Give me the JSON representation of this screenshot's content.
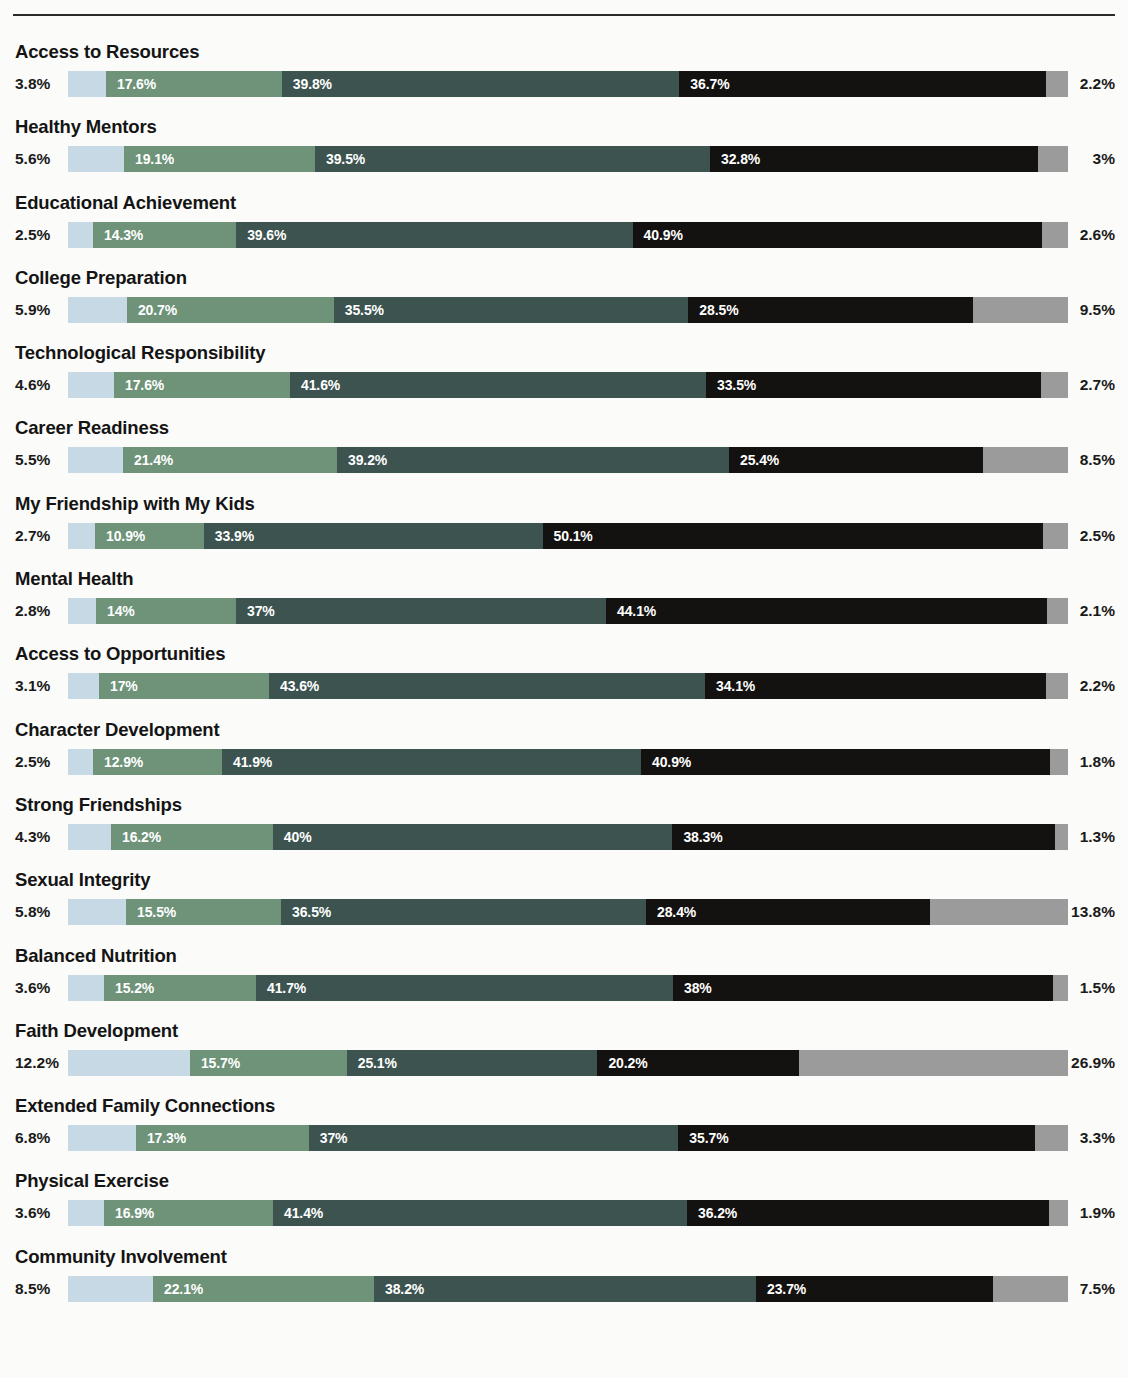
{
  "chart_data": {
    "type": "bar",
    "subtype": "stacked-horizontal-100",
    "title": "",
    "subtitle": "",
    "xlabel": "",
    "ylabel": "",
    "xlim": [
      0,
      100
    ],
    "grid": false,
    "legend_position": "none",
    "units": "percent",
    "series": [
      {
        "name": "segment-1",
        "color": "#c6d9e4",
        "label_visible": "left-outside"
      },
      {
        "name": "segment-2",
        "color": "#6e9379",
        "label_visible": "inside"
      },
      {
        "name": "segment-3",
        "color": "#3c5350",
        "label_visible": "inside"
      },
      {
        "name": "segment-4",
        "color": "#141210",
        "label_visible": "inside"
      },
      {
        "name": "segment-5",
        "color": "#9b9b9b",
        "label_visible": "right-outside"
      }
    ],
    "categories": [
      "Access to Resources",
      "Healthy Mentors",
      "Educational Achievement",
      "College Preparation",
      "Technological Responsibility",
      "Career Readiness",
      "My Friendship with My Kids",
      "Mental Health",
      "Access to Opportunities",
      "Character Development",
      "Strong Friendships",
      "Sexual Integrity",
      "Balanced Nutrition",
      "Faith Development",
      "Extended Family Connections",
      "Physical Exercise",
      "Community Involvement"
    ],
    "values": [
      [
        3.8,
        17.6,
        39.8,
        36.7,
        2.2
      ],
      [
        5.6,
        19.1,
        39.5,
        32.8,
        3.0
      ],
      [
        2.5,
        14.3,
        39.6,
        40.9,
        2.6
      ],
      [
        5.9,
        20.7,
        35.5,
        28.5,
        9.5
      ],
      [
        4.6,
        17.6,
        41.6,
        33.5,
        2.7
      ],
      [
        5.5,
        21.4,
        39.2,
        25.4,
        8.5
      ],
      [
        2.7,
        10.9,
        33.9,
        50.1,
        2.5
      ],
      [
        2.8,
        14.0,
        37.0,
        44.1,
        2.1
      ],
      [
        3.1,
        17.0,
        43.6,
        34.1,
        2.2
      ],
      [
        2.5,
        12.9,
        41.9,
        40.9,
        1.8
      ],
      [
        4.3,
        16.2,
        40.0,
        38.3,
        1.3
      ],
      [
        5.8,
        15.5,
        36.5,
        28.4,
        13.8
      ],
      [
        3.6,
        15.2,
        41.7,
        38.0,
        1.5
      ],
      [
        12.2,
        15.7,
        25.1,
        20.2,
        26.9
      ],
      [
        6.8,
        17.3,
        37.0,
        35.7,
        3.3
      ],
      [
        3.6,
        16.9,
        41.4,
        36.2,
        1.9
      ],
      [
        8.5,
        22.1,
        38.2,
        23.7,
        7.5
      ]
    ],
    "value_labels": [
      [
        "3.8%",
        "17.6%",
        "39.8%",
        "36.7%",
        "2.2%"
      ],
      [
        "5.6%",
        "19.1%",
        "39.5%",
        "32.8%",
        "3%"
      ],
      [
        "2.5%",
        "14.3%",
        "39.6%",
        "40.9%",
        "2.6%"
      ],
      [
        "5.9%",
        "20.7%",
        "35.5%",
        "28.5%",
        "9.5%"
      ],
      [
        "4.6%",
        "17.6%",
        "41.6%",
        "33.5%",
        "2.7%"
      ],
      [
        "5.5%",
        "21.4%",
        "39.2%",
        "25.4%",
        "8.5%"
      ],
      [
        "2.7%",
        "10.9%",
        "33.9%",
        "50.1%",
        "2.5%"
      ],
      [
        "2.8%",
        "14%",
        "37%",
        "44.1%",
        "2.1%"
      ],
      [
        "3.1%",
        "17%",
        "43.6%",
        "34.1%",
        "2.2%"
      ],
      [
        "2.5%",
        "12.9%",
        "41.9%",
        "40.9%",
        "1.8%"
      ],
      [
        "4.3%",
        "16.2%",
        "40%",
        "38.3%",
        "1.3%"
      ],
      [
        "5.8%",
        "15.5%",
        "36.5%",
        "28.4%",
        "13.8%"
      ],
      [
        "3.6%",
        "15.2%",
        "41.7%",
        "38%",
        "1.5%"
      ],
      [
        "12.2%",
        "15.7%",
        "25.1%",
        "20.2%",
        "26.9%"
      ],
      [
        "6.8%",
        "17.3%",
        "37%",
        "35.7%",
        "3.3%"
      ],
      [
        "3.6%",
        "16.9%",
        "41.4%",
        "36.2%",
        "1.9%"
      ],
      [
        "8.5%",
        "22.1%",
        "38.2%",
        "23.7%",
        "7.5%"
      ]
    ]
  },
  "colors": {
    "background": "#fbfbf9",
    "rule": "#2b2b2b",
    "text": "#141414",
    "segment_1": "#c6d9e4",
    "segment_2": "#6e9379",
    "segment_3": "#3c5350",
    "segment_4": "#141210",
    "segment_5": "#9b9b9b",
    "inside_label": "#ffffff"
  }
}
